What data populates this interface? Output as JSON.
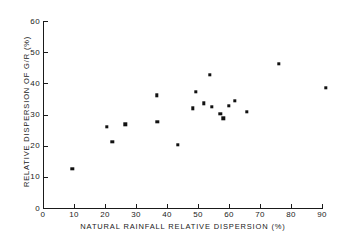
{
  "chart_data": {
    "type": "scatter",
    "title": "",
    "xlabel": "NATURAL  RAINFALL  RELATIVE  DISPERSION  (%)",
    "ylabel": "RELATIVE  DISPERSION  OF  G/R  (%)",
    "xlim": [
      0,
      90
    ],
    "ylim": [
      0,
      60
    ],
    "xticks": [
      0,
      10,
      20,
      30,
      40,
      50,
      60,
      70,
      80,
      90
    ],
    "yticks": [
      0,
      10,
      20,
      30,
      40,
      50,
      60
    ],
    "xtick_labels": [
      "0",
      "10",
      "20",
      "30",
      "40",
      "50",
      "60",
      "70",
      "80",
      "90"
    ],
    "ytick_labels": [
      "0",
      "10",
      "20",
      "30",
      "40",
      "50",
      "60"
    ],
    "grid": false,
    "legend": null,
    "marker": "square",
    "marker_color": "#111111",
    "points": [
      {
        "x": 9.4,
        "y": 12.5
      },
      {
        "x": 20.6,
        "y": 26.0
      },
      {
        "x": 22.3,
        "y": 21.2
      },
      {
        "x": 26.5,
        "y": 26.9
      },
      {
        "x": 36.8,
        "y": 36.1
      },
      {
        "x": 36.9,
        "y": 27.6
      },
      {
        "x": 43.5,
        "y": 20.2
      },
      {
        "x": 48.4,
        "y": 32.0
      },
      {
        "x": 49.2,
        "y": 37.3
      },
      {
        "x": 51.8,
        "y": 33.6
      },
      {
        "x": 53.9,
        "y": 42.8
      },
      {
        "x": 54.4,
        "y": 32.5
      },
      {
        "x": 57.2,
        "y": 30.2
      },
      {
        "x": 58.1,
        "y": 28.8
      },
      {
        "x": 60.0,
        "y": 32.7
      },
      {
        "x": 61.9,
        "y": 34.3
      },
      {
        "x": 65.7,
        "y": 30.9
      },
      {
        "x": 76.1,
        "y": 46.3
      },
      {
        "x": 91.3,
        "y": 38.5
      }
    ]
  }
}
